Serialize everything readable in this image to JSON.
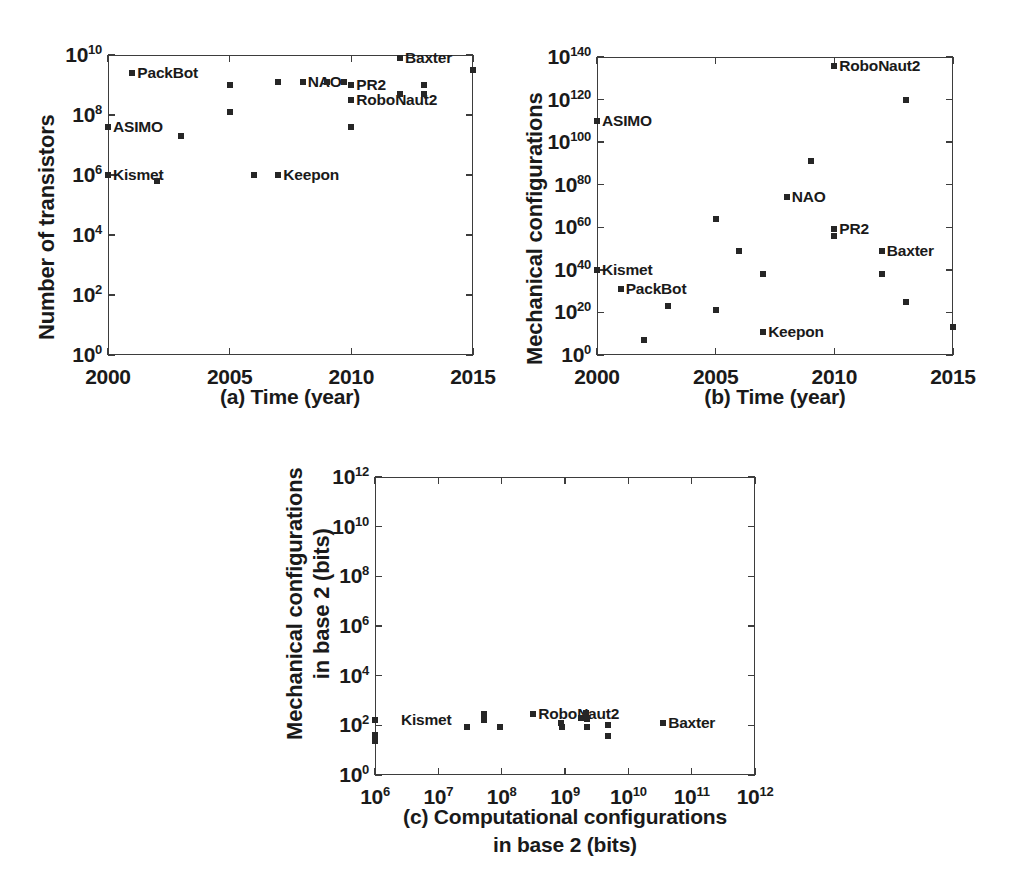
{
  "figure": {
    "background": "#ffffff",
    "marker_color": "#262626",
    "axis_color": "#3d3d3d"
  },
  "chart_data": [
    {
      "id": "panel-a",
      "type": "scatter",
      "title": "",
      "caption": "(a)  Time (year)",
      "xlabel": "Time (year)",
      "ylabel": "Number of transistors",
      "xlim": [
        2000,
        2015
      ],
      "ylim_exp": [
        0,
        10
      ],
      "yscale": "log",
      "grid": false,
      "xticks": [
        "2000",
        "2005",
        "2010",
        "2015"
      ],
      "xtick_values": [
        2000,
        2005,
        2010,
        2015
      ],
      "yticks": [
        {
          "mantissa": "10",
          "exp": "0",
          "value_exp": 0
        },
        {
          "mantissa": "10",
          "exp": "2",
          "value_exp": 2
        },
        {
          "mantissa": "10",
          "exp": "4",
          "value_exp": 4
        },
        {
          "mantissa": "10",
          "exp": "6",
          "value_exp": 6
        },
        {
          "mantissa": "10",
          "exp": "8",
          "value_exp": 8
        },
        {
          "mantissa": "10",
          "exp": "10",
          "value_exp": 10
        }
      ],
      "points": [
        {
          "x": 2000,
          "y_exp": 7.6,
          "label": "ASIMO",
          "label_side": "right"
        },
        {
          "x": 2000,
          "y_exp": 6.0,
          "label": "Kismet",
          "label_side": "right"
        },
        {
          "x": 2001,
          "y_exp": 9.4,
          "label": "PackBot",
          "label_side": "right"
        },
        {
          "x": 2002,
          "y_exp": 5.8,
          "label": "",
          "label_side": "right"
        },
        {
          "x": 2003,
          "y_exp": 7.3,
          "label": "",
          "label_side": "right"
        },
        {
          "x": 2005,
          "y_exp": 9.0,
          "label": "",
          "label_side": "right"
        },
        {
          "x": 2005,
          "y_exp": 8.1,
          "label": "",
          "label_side": "right"
        },
        {
          "x": 2006,
          "y_exp": 6.0,
          "label": "",
          "label_side": "right"
        },
        {
          "x": 2007,
          "y_exp": 9.1,
          "label": "",
          "label_side": "right"
        },
        {
          "x": 2007,
          "y_exp": 6.0,
          "label": "Keepon",
          "label_side": "right"
        },
        {
          "x": 2008,
          "y_exp": 9.1,
          "label": "NAO",
          "label_side": "right"
        },
        {
          "x": 2009,
          "y_exp": 9.1,
          "label": "",
          "label_side": "right"
        },
        {
          "x": 2010,
          "y_exp": 9.0,
          "label": "PR2",
          "label_side": "right"
        },
        {
          "x": 2010,
          "y_exp": 8.5,
          "label": "RoboNaut2",
          "label_side": "right"
        },
        {
          "x": 2010,
          "y_exp": 7.6,
          "label": "",
          "label_side": "right"
        },
        {
          "x": 2012,
          "y_exp": 9.9,
          "label": "Baxter",
          "label_side": "right"
        },
        {
          "x": 2012,
          "y_exp": 8.7,
          "label": "",
          "label_side": "right"
        },
        {
          "x": 2013,
          "y_exp": 9.0,
          "label": "",
          "label_side": "right"
        },
        {
          "x": 2013,
          "y_exp": 8.7,
          "label": "",
          "label_side": "right"
        },
        {
          "x": 2015,
          "y_exp": 9.5,
          "label": "",
          "label_side": "right"
        }
      ]
    },
    {
      "id": "panel-b",
      "type": "scatter",
      "title": "",
      "caption": "(b)  Time (year)",
      "xlabel": "Time (year)",
      "ylabel": "Mechanical configurations",
      "xlim": [
        2000,
        2015
      ],
      "ylim_exp": [
        0,
        140
      ],
      "yscale": "log",
      "grid": false,
      "xticks": [
        "2000",
        "2005",
        "2010",
        "2015"
      ],
      "xtick_values": [
        2000,
        2005,
        2010,
        2015
      ],
      "yticks": [
        {
          "mantissa": "10",
          "exp": "0",
          "value_exp": 0
        },
        {
          "mantissa": "10",
          "exp": "20",
          "value_exp": 20
        },
        {
          "mantissa": "10",
          "exp": "40",
          "value_exp": 40
        },
        {
          "mantissa": "10",
          "exp": "60",
          "value_exp": 60
        },
        {
          "mantissa": "10",
          "exp": "80",
          "value_exp": 80
        },
        {
          "mantissa": "10",
          "exp": "100",
          "value_exp": 100
        },
        {
          "mantissa": "10",
          "exp": "120",
          "value_exp": 120
        },
        {
          "mantissa": "10",
          "exp": "140",
          "value_exp": 140
        }
      ],
      "points": [
        {
          "x": 2000,
          "y_exp": 110,
          "label": "ASIMO",
          "label_side": "right"
        },
        {
          "x": 2000,
          "y_exp": 40,
          "label": "Kismet",
          "label_side": "right"
        },
        {
          "x": 2001,
          "y_exp": 31,
          "label": "PackBot",
          "label_side": "right"
        },
        {
          "x": 2002,
          "y_exp": 7,
          "label": "",
          "label_side": "right"
        },
        {
          "x": 2003,
          "y_exp": 23,
          "label": "",
          "label_side": "right"
        },
        {
          "x": 2005,
          "y_exp": 64,
          "label": "",
          "label_side": "right"
        },
        {
          "x": 2005,
          "y_exp": 21,
          "label": "",
          "label_side": "right"
        },
        {
          "x": 2006,
          "y_exp": 49,
          "label": "",
          "label_side": "right"
        },
        {
          "x": 2007,
          "y_exp": 38,
          "label": "",
          "label_side": "right"
        },
        {
          "x": 2007,
          "y_exp": 11,
          "label": "Keepon",
          "label_side": "right"
        },
        {
          "x": 2008,
          "y_exp": 74,
          "label": "NAO",
          "label_side": "right"
        },
        {
          "x": 2009,
          "y_exp": 91,
          "label": "",
          "label_side": "right"
        },
        {
          "x": 2010,
          "y_exp": 136,
          "label": "RoboNaut2",
          "label_side": "right"
        },
        {
          "x": 2010,
          "y_exp": 59,
          "label": "PR2",
          "label_side": "right"
        },
        {
          "x": 2010,
          "y_exp": 56,
          "label": "",
          "label_side": "right"
        },
        {
          "x": 2012,
          "y_exp": 49,
          "label": "Baxter",
          "label_side": "right"
        },
        {
          "x": 2012,
          "y_exp": 38,
          "label": "",
          "label_side": "right"
        },
        {
          "x": 2013,
          "y_exp": 120,
          "label": "",
          "label_side": "right"
        },
        {
          "x": 2013,
          "y_exp": 25,
          "label": "",
          "label_side": "right"
        },
        {
          "x": 2015,
          "y_exp": 13,
          "label": "",
          "label_side": "right"
        }
      ]
    },
    {
      "id": "panel-c",
      "type": "scatter",
      "title": "",
      "caption_line1": "(c)  Computational configurations",
      "caption_line2": "in base 2 (bits)",
      "xlabel": "Computational configurations in base 2 (bits)",
      "ylabel_line1": "Mechanical configurations",
      "ylabel_line2": "in base 2 (bits)",
      "xlim_exp": [
        6,
        12
      ],
      "ylim_exp": [
        0,
        12
      ],
      "xscale": "log",
      "yscale": "log",
      "grid": false,
      "xticks": [
        {
          "mantissa": "10",
          "exp": "6",
          "value_exp": 6
        },
        {
          "mantissa": "10",
          "exp": "7",
          "value_exp": 7
        },
        {
          "mantissa": "10",
          "exp": "8",
          "value_exp": 8
        },
        {
          "mantissa": "10",
          "exp": "9",
          "value_exp": 9
        },
        {
          "mantissa": "10",
          "exp": "10",
          "value_exp": 10
        },
        {
          "mantissa": "10",
          "exp": "11",
          "value_exp": 11
        },
        {
          "mantissa": "10",
          "exp": "12",
          "value_exp": 12
        }
      ],
      "yticks": [
        {
          "mantissa": "10",
          "exp": "0",
          "value_exp": 0
        },
        {
          "mantissa": "10",
          "exp": "2",
          "value_exp": 2
        },
        {
          "mantissa": "10",
          "exp": "4",
          "value_exp": 4
        },
        {
          "mantissa": "10",
          "exp": "6",
          "value_exp": 6
        },
        {
          "mantissa": "10",
          "exp": "8",
          "value_exp": 8
        },
        {
          "mantissa": "10",
          "exp": "10",
          "value_exp": 10
        },
        {
          "mantissa": "10",
          "exp": "12",
          "value_exp": 12
        }
      ],
      "points": [
        {
          "x_exp": 6.0,
          "y_exp": 2.22,
          "label": "Kismet",
          "label_side": "right",
          "label_dx": 26
        },
        {
          "x_exp": 6.0,
          "y_exp": 1.62,
          "label": "",
          "label_side": "right"
        },
        {
          "x_exp": 6.0,
          "y_exp": 1.35,
          "label": "",
          "label_side": "right"
        },
        {
          "x_exp": 7.45,
          "y_exp": 1.92,
          "label": "",
          "label_side": "right"
        },
        {
          "x_exp": 7.72,
          "y_exp": 2.45,
          "label": "",
          "label_side": "right"
        },
        {
          "x_exp": 7.72,
          "y_exp": 2.22,
          "label": "",
          "label_side": "right"
        },
        {
          "x_exp": 7.98,
          "y_exp": 1.92,
          "label": "",
          "label_side": "right"
        },
        {
          "x_exp": 8.5,
          "y_exp": 2.45,
          "label": "RoboNaut2",
          "label_side": "right"
        },
        {
          "x_exp": 8.93,
          "y_exp": 2.1,
          "label": "",
          "label_side": "right"
        },
        {
          "x_exp": 8.96,
          "y_exp": 1.92,
          "label": "",
          "label_side": "right"
        },
        {
          "x_exp": 9.25,
          "y_exp": 2.3,
          "label": "",
          "label_side": "right"
        },
        {
          "x_exp": 9.33,
          "y_exp": 2.48,
          "label": "",
          "label_side": "right"
        },
        {
          "x_exp": 9.35,
          "y_exp": 2.25,
          "label": "",
          "label_side": "right"
        },
        {
          "x_exp": 9.35,
          "y_exp": 1.95,
          "label": "",
          "label_side": "right"
        },
        {
          "x_exp": 9.68,
          "y_exp": 2.02,
          "label": "",
          "label_side": "right"
        },
        {
          "x_exp": 9.68,
          "y_exp": 1.58,
          "label": "",
          "label_side": "right"
        },
        {
          "x_exp": 10.55,
          "y_exp": 2.1,
          "label": "Baxter",
          "label_side": "right"
        }
      ]
    }
  ]
}
